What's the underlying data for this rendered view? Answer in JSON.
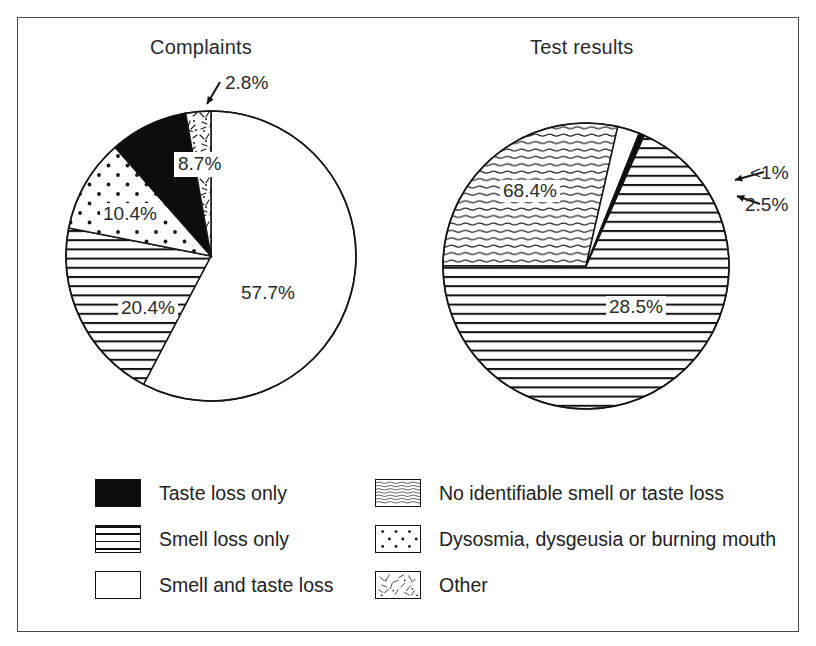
{
  "figure": {
    "background": "#ffffff",
    "frame_color": "#4a4a4a"
  },
  "charts": {
    "left": {
      "title": "Complaints",
      "labels": {
        "p1": "57.7%",
        "p2": "20.4%",
        "p3": "10.4%",
        "p4": "8.7%",
        "p5": "2.8%"
      }
    },
    "right": {
      "title": "Test results",
      "labels": {
        "p1": "68.4%",
        "p2": "28.5%",
        "p3": "2.5%",
        "p4": "<1%"
      }
    }
  },
  "legend": {
    "left_column": [
      {
        "label": "Taste loss only",
        "pattern": "solid-black"
      },
      {
        "label": "Smell loss only",
        "pattern": "horizontal-lines"
      },
      {
        "label": "Smell and taste loss",
        "pattern": "white"
      }
    ],
    "right_column": [
      {
        "label": "No identifiable smell or taste loss",
        "pattern": "wavy-lines"
      },
      {
        "label": "Dysosmia, dysgeusia or burning mouth",
        "pattern": "dots"
      },
      {
        "label": "Other",
        "pattern": "speckle"
      }
    ]
  },
  "chart_data": [
    {
      "type": "pie",
      "title": "Complaints",
      "categories": [
        "Smell and taste loss",
        "Smell loss only",
        "Dysosmia, dysgeusia or burning mouth",
        "Taste loss only",
        "Other"
      ],
      "values": [
        57.7,
        20.4,
        10.4,
        8.7,
        2.8
      ],
      "value_labels": [
        "57.7%",
        "20.4%",
        "10.4%",
        "8.7%",
        "2.8%"
      ],
      "patterns": [
        "white",
        "horizontal-lines",
        "dots",
        "solid-black",
        "speckle"
      ],
      "start_angle_deg": 0,
      "direction": "clockwise",
      "legend_position": "bottom",
      "grid": false,
      "xlabel": "",
      "ylabel": ""
    },
    {
      "type": "pie",
      "title": "Test results",
      "categories": [
        "Smell loss only",
        "No identifiable smell or taste loss",
        "Smell and taste loss",
        "Taste loss only"
      ],
      "values": [
        68.4,
        28.5,
        2.5,
        0.6
      ],
      "value_labels": [
        "68.4%",
        "28.5%",
        "2.5%",
        "<1%"
      ],
      "patterns": [
        "horizontal-lines",
        "wavy-lines",
        "white",
        "solid-black"
      ],
      "start_angle_deg": 24,
      "direction": "clockwise",
      "legend_position": "bottom",
      "grid": false,
      "xlabel": "",
      "ylabel": ""
    }
  ]
}
